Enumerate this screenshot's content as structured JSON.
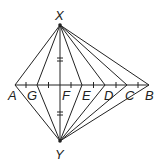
{
  "diagram": {
    "points": {
      "X": {
        "label": "X",
        "x": 60,
        "y": 25
      },
      "Y": {
        "label": "Y",
        "x": 60,
        "y": 141
      },
      "A": {
        "label": "A",
        "x": 15,
        "y": 85
      },
      "G": {
        "label": "G",
        "x": 37,
        "y": 85
      },
      "F": {
        "label": "F",
        "x": 60,
        "y": 85
      },
      "E": {
        "label": "E",
        "x": 82,
        "y": 85
      },
      "D": {
        "label": "D",
        "x": 105,
        "y": 85
      },
      "C": {
        "label": "C",
        "x": 127,
        "y": 85
      },
      "B": {
        "label": "B",
        "x": 149,
        "y": 85
      }
    },
    "segments": [
      [
        "A",
        "B"
      ],
      [
        "X",
        "Y"
      ],
      [
        "X",
        "A"
      ],
      [
        "X",
        "G"
      ],
      [
        "X",
        "E"
      ],
      [
        "X",
        "D"
      ],
      [
        "X",
        "C"
      ],
      [
        "X",
        "B"
      ],
      [
        "Y",
        "A"
      ],
      [
        "Y",
        "G"
      ],
      [
        "Y",
        "E"
      ],
      [
        "Y",
        "D"
      ],
      [
        "Y",
        "C"
      ],
      [
        "Y",
        "B"
      ]
    ],
    "congruence_marks": "XF and FY marked equal (double tick); AB divided into equal segments with single ticks",
    "line_color": "#222222"
  }
}
